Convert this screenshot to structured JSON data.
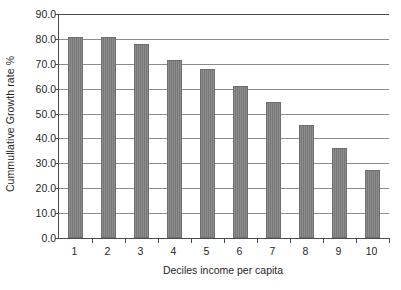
{
  "chart_data": {
    "type": "bar",
    "title": "",
    "xlabel": "Deciles income per capita",
    "ylabel": "Cummullative Growth rate %",
    "categories": [
      "1",
      "2",
      "3",
      "4",
      "5",
      "6",
      "7",
      "8",
      "9",
      "10"
    ],
    "values": [
      80.7,
      80.7,
      77.9,
      71.6,
      67.8,
      61.1,
      54.5,
      45.6,
      36.3,
      27.2
    ],
    "ylim": [
      0.0,
      90.0
    ],
    "ytick_labels": [
      "0.0",
      "10.0",
      "20.0",
      "30.0",
      "40.0",
      "50.0",
      "60.0",
      "70.0",
      "80.0",
      "90.0"
    ],
    "ytick_values": [
      0.0,
      10.0,
      20.0,
      30.0,
      40.0,
      50.0,
      60.0,
      70.0,
      80.0,
      90.0
    ],
    "grid": true,
    "legend": "none",
    "bar_color": "#808080",
    "axis_color": "#4d4d4d",
    "gridline_color": "#8c8c8c"
  }
}
